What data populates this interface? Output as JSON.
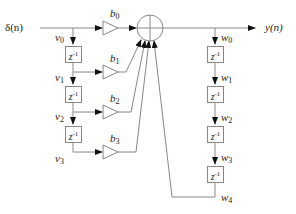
{
  "diagram": {
    "type": "signal-flow",
    "input": {
      "label": "δ(n)"
    },
    "output": {
      "label": "y(n)"
    },
    "summer": {
      "symbol": "⊕"
    },
    "delay_label": "z",
    "delay_exp": "-1",
    "left_nodes": [
      {
        "name": "v",
        "sub": "0"
      },
      {
        "name": "v",
        "sub": "1"
      },
      {
        "name": "v",
        "sub": "2"
      },
      {
        "name": "v",
        "sub": "3"
      }
    ],
    "gains": [
      {
        "name": "b",
        "sub": "0"
      },
      {
        "name": "b",
        "sub": "1"
      },
      {
        "name": "b",
        "sub": "2"
      },
      {
        "name": "b",
        "sub": "3"
      }
    ],
    "right_nodes": [
      {
        "name": "w",
        "sub": "0"
      },
      {
        "name": "w",
        "sub": "1"
      },
      {
        "name": "w",
        "sub": "2"
      },
      {
        "name": "w",
        "sub": "3"
      },
      {
        "name": "w",
        "sub": "4"
      }
    ],
    "colors": {
      "line": "#888888",
      "arrow": "#111111",
      "text": "#222222"
    }
  }
}
